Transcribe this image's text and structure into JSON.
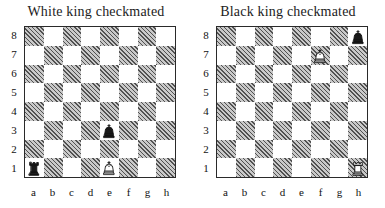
{
  "figure": {
    "type": "chess-diagram-pair",
    "background": "#ffffff"
  },
  "chart_data": {
    "type": "table",
    "boards": [
      {
        "title": "White king checkmated",
        "orientation": "white-bottom",
        "files": [
          "a",
          "b",
          "c",
          "d",
          "e",
          "f",
          "g",
          "h"
        ],
        "ranks": [
          "8",
          "7",
          "6",
          "5",
          "4",
          "3",
          "2",
          "1"
        ],
        "pieces": [
          {
            "square": "a1",
            "color": "black",
            "type": "rook",
            "glyph": "♜"
          },
          {
            "square": "e1",
            "color": "white",
            "type": "king",
            "glyph": "♔"
          },
          {
            "square": "e3",
            "color": "black",
            "type": "king",
            "glyph": "♚"
          }
        ]
      },
      {
        "title": "Black king checkmated",
        "orientation": "white-bottom",
        "files": [
          "a",
          "b",
          "c",
          "d",
          "e",
          "f",
          "g",
          "h"
        ],
        "ranks": [
          "8",
          "7",
          "6",
          "5",
          "4",
          "3",
          "2",
          "1"
        ],
        "pieces": [
          {
            "square": "h8",
            "color": "black",
            "type": "king",
            "glyph": "♚"
          },
          {
            "square": "f7",
            "color": "white",
            "type": "king",
            "glyph": "♔"
          },
          {
            "square": "h1",
            "color": "white",
            "type": "rook",
            "glyph": "♖"
          }
        ]
      }
    ],
    "colors": {
      "light_square": "#ffffff",
      "dark_square": "#c9c9c9",
      "border": "#2a2a2a",
      "text": "#1c1c1c"
    }
  }
}
